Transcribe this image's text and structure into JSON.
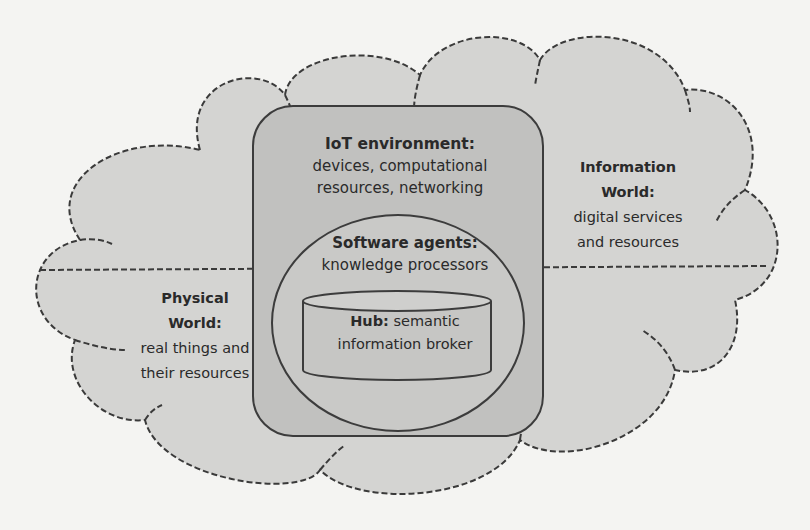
{
  "diagram": {
    "type": "nested-layer architecture",
    "colors": {
      "page_background": "#f4f4f2",
      "cloud_fill": "#d4d4d2",
      "cloud_stroke": "#3a3a3a",
      "iot_box_fill": "#c1c1bf",
      "agents_ellipse_fill": "#c9c9c7",
      "hub_cylinder_fill": "#c6c6c4",
      "outline": "#3c3c3c",
      "text": "#2a2a2a"
    },
    "cloud": {
      "description": "dashed cloud split by a horizontal dashed line",
      "divider": "horizontal dashed line"
    },
    "iot_environment": {
      "title": "IoT environment:",
      "line1": "devices, computational",
      "line2": "resources, networking"
    },
    "software_agents": {
      "title": "Software agents:",
      "line1": "knowledge processors"
    },
    "hub": {
      "title": "Hub:",
      "title_rest": " semantic",
      "line2": "information broker"
    },
    "physical_world": {
      "title_line1": "Physical",
      "title_line2": "World:",
      "line1": "real things and",
      "line2": "their resources"
    },
    "information_world": {
      "title_line1": "Information",
      "title_line2": "World:",
      "line1": "digital services",
      "line2": "and resources"
    }
  }
}
